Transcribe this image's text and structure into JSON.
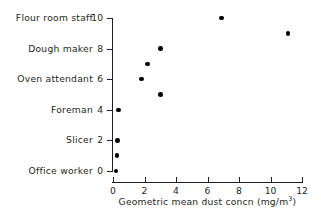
{
  "chart_data": {
    "type": "scatter",
    "title": "",
    "xlabel": "Geometric mean dust concn (mg/m",
    "xlabel_sup": "3",
    "xlabel_tail": ")",
    "ylabel": "",
    "xlim": [
      0,
      12
    ],
    "ylim": [
      0,
      10
    ],
    "grid": false,
    "legend": null,
    "xticks": [
      0,
      2,
      4,
      6,
      8,
      10,
      12
    ],
    "xticklabels": [
      "0",
      "2",
      "4",
      "6",
      "8",
      "10",
      "12"
    ],
    "yticks": [
      0,
      2,
      4,
      6,
      8,
      10
    ],
    "yticklabels": [
      "0",
      "2",
      "4",
      "6",
      "8",
      "10"
    ],
    "category_labels": [
      {
        "text": "Flour room staff",
        "y": 10
      },
      {
        "text": "Dough maker",
        "y": 8
      },
      {
        "text": "Oven attendant",
        "y": 6
      },
      {
        "text": "Foreman",
        "y": 4
      },
      {
        "text": "Slicer",
        "y": 2
      },
      {
        "text": "Office worker",
        "y": 0
      }
    ],
    "points": [
      {
        "x": 0.2,
        "y": 0
      },
      {
        "x": 0.25,
        "y": 1
      },
      {
        "x": 0.3,
        "y": 2
      },
      {
        "x": 0.35,
        "y": 4
      },
      {
        "x": 1.8,
        "y": 6
      },
      {
        "x": 2.2,
        "y": 7
      },
      {
        "x": 3.0,
        "y": 8
      },
      {
        "x": 3.0,
        "y": 5
      },
      {
        "x": 6.9,
        "y": 10
      },
      {
        "x": 11.1,
        "y": 9
      }
    ],
    "marker_color": "#000000",
    "axis_color": "#231f20"
  }
}
